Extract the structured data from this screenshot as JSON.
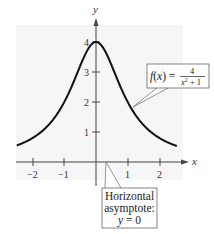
{
  "chart_data": {
    "type": "line",
    "title": "",
    "function": "f(x) = 4/(x^2+1)",
    "xlabel": "x",
    "ylabel": "y",
    "xlim": [
      -2.5,
      2.6
    ],
    "ylim": [
      -0.6,
      4.6
    ],
    "grid": false,
    "x_ticks": [
      -2,
      -1,
      1,
      2
    ],
    "x_tick_labels": [
      "−2",
      "−1",
      "1",
      "2"
    ],
    "y_ticks": [
      1,
      2,
      3,
      4
    ],
    "y_tick_labels": [
      "1",
      "2",
      "3",
      "4"
    ],
    "series": [
      {
        "name": "f(x) = 4/(x²+1)",
        "x": [
          -2.5,
          -2,
          -1.5,
          -1,
          -0.5,
          0,
          0.5,
          1,
          1.5,
          2,
          2.5
        ],
        "y": [
          0.552,
          0.8,
          1.231,
          2,
          3.2,
          4,
          3.2,
          2,
          1.231,
          0.8,
          0.552
        ]
      }
    ],
    "annotations": [
      {
        "text": "f(x) = 4/(x²+1)",
        "points_to": "curve near x=1.2"
      },
      {
        "text": "Horizontal asymptote: y = 0",
        "points_to": "x-axis"
      }
    ]
  },
  "axes": {
    "x_label": "x",
    "y_label": "y",
    "x_tick_labels": [
      "−2",
      "−1",
      "1",
      "2"
    ],
    "y_tick_labels": [
      "1",
      "2",
      "3",
      "4"
    ]
  },
  "function_callout": {
    "lhs": "f(x) = ",
    "numerator": "4",
    "denominator_base": "x",
    "denominator_exp": "2",
    "denominator_rest": " + 1"
  },
  "asymptote_callout": {
    "line1": "Horizontal",
    "line2": "asymptote:",
    "line3": "y = 0"
  },
  "colors": {
    "curve": "#111111",
    "axes": "#444444",
    "plot_background": "#f6f6f6",
    "callout_border": "#666666"
  }
}
